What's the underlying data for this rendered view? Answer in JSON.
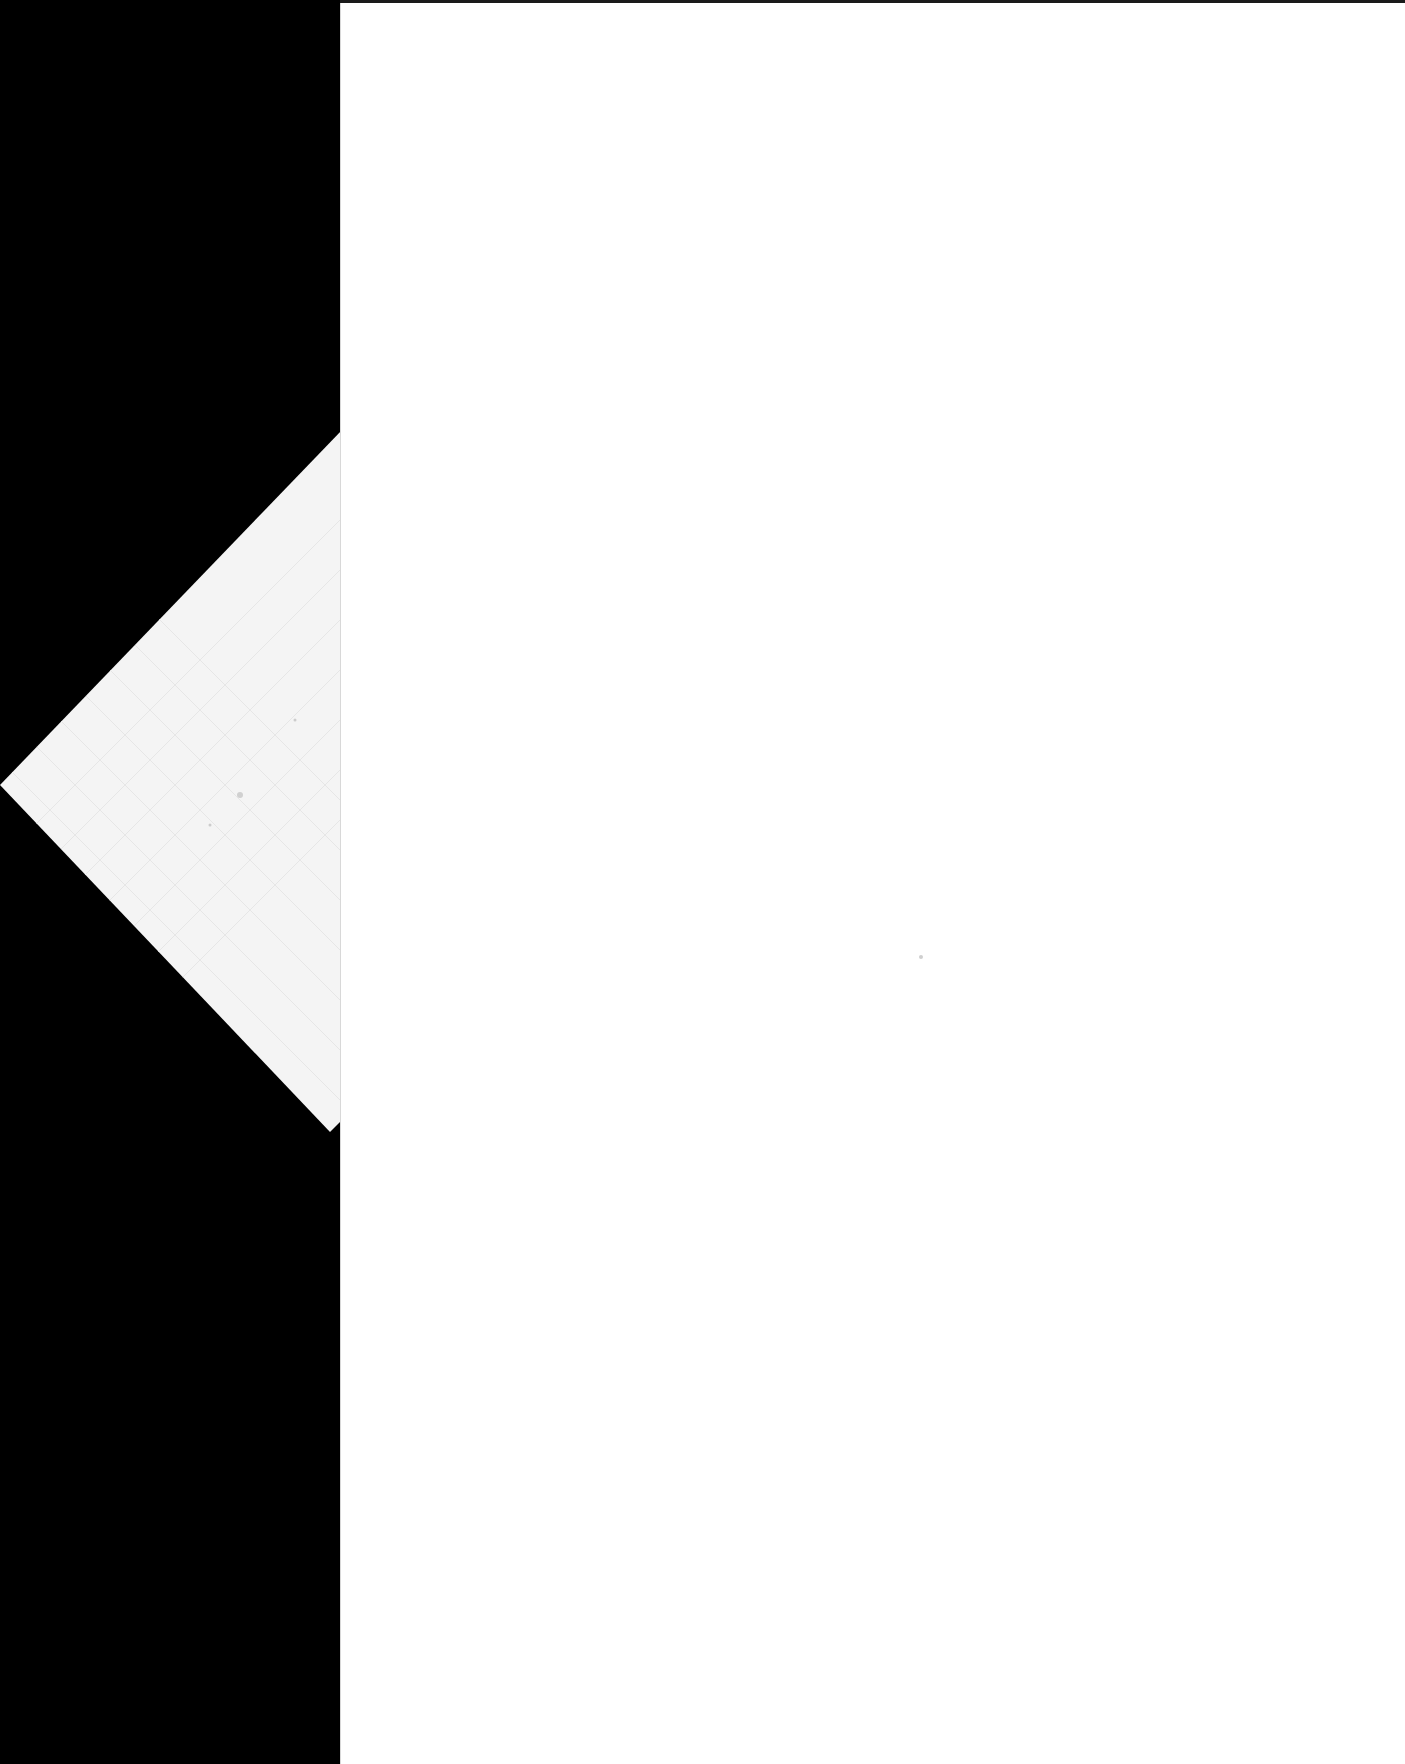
{
  "document": {
    "type": "scanned-blank-page",
    "text": "",
    "label": "Blank scanned page"
  },
  "colors": {
    "background": "#000000",
    "page": "#ffffff",
    "folded_corner": "#f4f4f4",
    "grid_lines": "#e6e6e6"
  }
}
